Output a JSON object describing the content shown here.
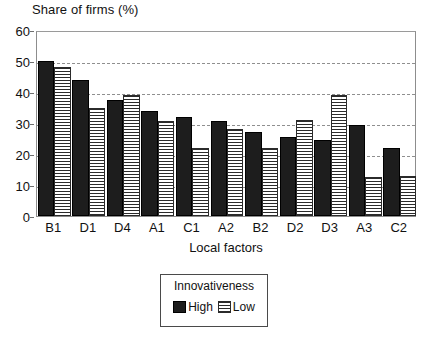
{
  "chart_data": {
    "type": "bar",
    "title": "Share of firms (%)",
    "xlabel": "Local factors",
    "ylabel": "Share of firms (%)",
    "ylim": [
      0,
      60
    ],
    "yticks": [
      0,
      10,
      20,
      30,
      40,
      50,
      60
    ],
    "grid": true,
    "categories": [
      "B1",
      "D1",
      "D4",
      "A1",
      "C1",
      "A2",
      "B2",
      "D2",
      "D3",
      "A3",
      "C2"
    ],
    "series": [
      {
        "name": "High",
        "color": "#1d1d1d",
        "values": [
          50,
          44,
          37.5,
          34,
          32,
          30.5,
          27,
          25.5,
          24.5,
          29.5,
          22
        ]
      },
      {
        "name": "Low",
        "color": "#ffffff",
        "values": [
          48,
          35,
          39,
          30.5,
          22,
          28,
          22,
          31,
          39,
          12.5,
          13
        ]
      }
    ],
    "legend": {
      "title": "Innovativeness",
      "position": "bottom-center",
      "entries": [
        "High",
        "Low"
      ]
    }
  }
}
